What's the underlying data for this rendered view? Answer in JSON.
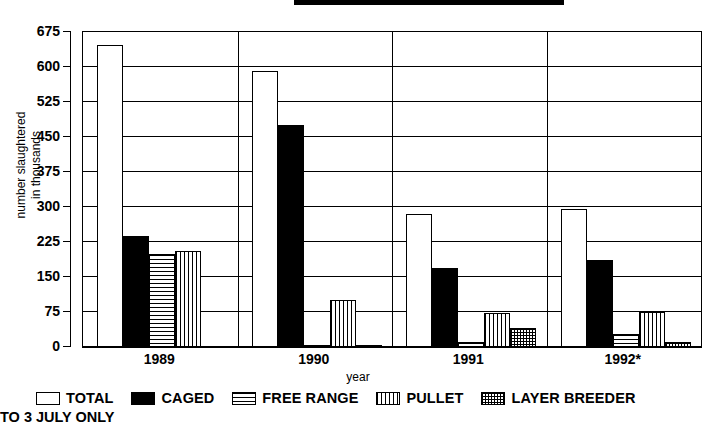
{
  "header": {
    "title_bar": ""
  },
  "chart_data": {
    "type": "bar",
    "title": "",
    "xlabel": "year",
    "ylabel": "number slaughtered\nin thousands",
    "ylabel_line1": "number slaughtered",
    "ylabel_line2": "in thousands",
    "categories": [
      "1989",
      "1990",
      "1991",
      "1992*"
    ],
    "ylim": [
      0,
      675
    ],
    "yticks": [
      0,
      75,
      150,
      225,
      300,
      375,
      450,
      525,
      600,
      675
    ],
    "ytick_labels": [
      "0",
      "75",
      "150",
      "225",
      "300",
      "375",
      "450",
      "525",
      "600",
      "675"
    ],
    "grid": true,
    "legend_position": "bottom",
    "series": [
      {
        "name": "TOTAL",
        "pattern": "solid-white",
        "values": [
          648,
          592,
          285,
          295
        ]
      },
      {
        "name": "CAGED",
        "pattern": "solid-black",
        "values": [
          238,
          475,
          170,
          187
        ]
      },
      {
        "name": "FREE RANGE",
        "pattern": "horizontal-lines",
        "values": [
          200,
          3,
          10,
          27
        ]
      },
      {
        "name": "PULLET",
        "pattern": "vertical-lines",
        "values": [
          205,
          100,
          72,
          75
        ]
      },
      {
        "name": "LAYER BREEDER",
        "pattern": "cross-hatch",
        "values": [
          0,
          5,
          40,
          10
        ]
      }
    ],
    "annotations": [
      "TO 3 JULY ONLY"
    ]
  },
  "legend": {
    "items": [
      {
        "label": "TOTAL"
      },
      {
        "label": "CAGED"
      },
      {
        "label": "FREE RANGE"
      },
      {
        "label": "PULLET"
      },
      {
        "label": "LAYER BREEDER"
      }
    ]
  },
  "footnote": {
    "text": "TO 3 JULY ONLY"
  },
  "colors": {
    "foreground": "#000000",
    "background": "#ffffff"
  }
}
